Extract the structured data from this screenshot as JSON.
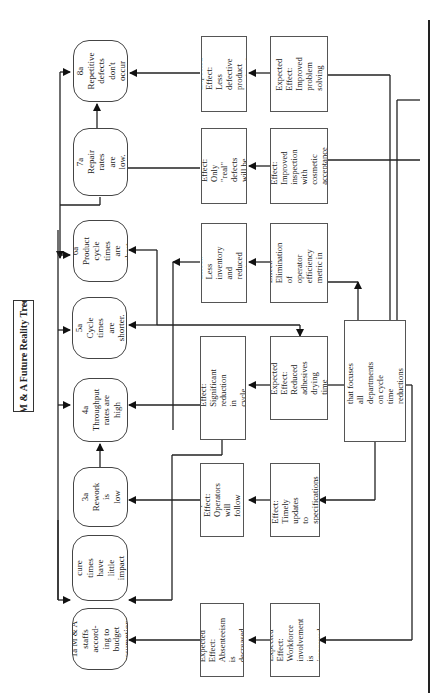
{
  "title": "M & A Future Reality Tree",
  "outcomes": [
    {
      "id": "8a",
      "text": "8a Repetitive\ndefects don't\noccur"
    },
    {
      "id": "7a",
      "text": "7a Repair\nrates are low."
    },
    {
      "id": "6a",
      "text": "6a Product\ncycle times\nare short."
    },
    {
      "id": "5a",
      "text": "5a Cycle times\nare shorter."
    },
    {
      "id": "4a",
      "text": "4a\nThroughput\nrates are high"
    },
    {
      "id": "3a",
      "text": "3a Rework is\nlow"
    },
    {
      "id": "2a",
      "text": "2a Adhesive\ncure times have\nlittle impact\non cycle time"
    },
    {
      "id": "1a",
      "text": "1a M & A\nstaffs accord-\ning to budget\nassumptions"
    }
  ],
  "effects_inner": [
    {
      "text": "Expected Effect:\nLess defective\nproduct produced"
    },
    {
      "text": "Expected Effect:\nOnly \"real\" defects\nwill be found"
    },
    {
      "text": "Expected Effect:\nLess inventory and\nreduced cycle time."
    },
    {
      "text": "Expected Effect:\nSignificant\nreduction in\ncycle times"
    },
    {
      "text": "Expected Effect:\nOperators will\nfollow spec"
    },
    {
      "text": "Expected Effect:\nAbsenteeism is\ndecreased"
    }
  ],
  "effects_outer": [
    {
      "text": "Expected Effect:\nImproved\nproblem solving"
    },
    {
      "text": "Expected Effect:\nImproved\ninspection with\ncosmetic\nacceptance stds"
    },
    {
      "text": "Expected Effect:\nElimination of\noperator efficiency\nmetric in\nnon-constraints"
    },
    {
      "text": "Expected Effect:\nReduced\nadhesives drying\ntime"
    },
    {
      "text": "Expected Effect:\nTimely updates\nto specifications\nfrom CRD"
    },
    {
      "text": "Expected Effect:\nWorkforce\ninvolvement is\nimproved"
    }
  ],
  "root": {
    "text": "We have an improvement\nplan in place that focuses all\ndepartments on cycle time\nreductions that result in\nthroughput increases."
  }
}
